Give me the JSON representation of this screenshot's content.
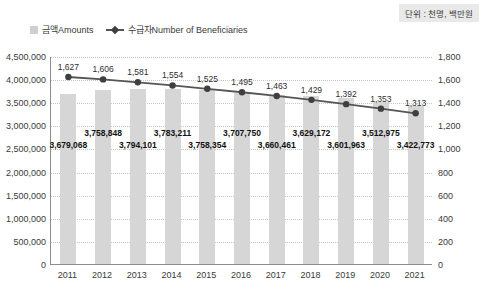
{
  "unit_label": "단위 : 천명, 백만원",
  "legend": {
    "amounts_label": "금액Amounts",
    "beneficiaries_label": "수급자Number of Beneficiaries"
  },
  "colors": {
    "bar": "#d6d6d6",
    "line": "#555555",
    "marker": "#3f3f3f",
    "grid": "#c6c6c6",
    "axis": "#8c8c8c",
    "bar_label": "#111111",
    "line_label": "#2e2e2e",
    "unit_bg": "#e9e9e9"
  },
  "chart_data": {
    "type": "bar",
    "subtype": "bar-and-line-combo",
    "title": "",
    "categories": [
      "2011",
      "2012",
      "2013",
      "2014",
      "2015",
      "2016",
      "2017",
      "2018",
      "2019",
      "2020",
      "2021"
    ],
    "series": [
      {
        "name": "금액Amounts",
        "type": "bar",
        "axis": "left",
        "values": [
          3679068,
          3758848,
          3794101,
          3783211,
          3758354,
          3707750,
          3660461,
          3629172,
          3601963,
          3512975,
          3422773
        ]
      },
      {
        "name": "수급자Number of Beneficiaries",
        "type": "line",
        "axis": "right",
        "values": [
          1627,
          1606,
          1581,
          1554,
          1525,
          1495,
          1463,
          1429,
          1392,
          1353,
          1313
        ]
      }
    ],
    "left_axis": {
      "min": 0,
      "max": 4500000,
      "tick_labels": [
        "4,500,000",
        "4,000,000",
        "3,500,000",
        "3,000,000",
        "2,500,000",
        "2,000,000",
        "1,500,000",
        "1,000,000",
        "500,000",
        "0"
      ]
    },
    "right_axis": {
      "min": 0,
      "max": 1800,
      "tick_labels": [
        "1,800",
        "1,600",
        "1,400",
        "1,200",
        "1,000",
        "800",
        "600",
        "400",
        "200",
        "0"
      ]
    },
    "grid": "dotted-horizontal",
    "legend_position": "top-left",
    "data_labels": "on"
  }
}
